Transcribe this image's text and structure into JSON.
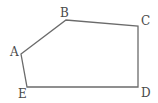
{
  "figure": {
    "type": "pentagon",
    "stroke_color": "#6b6b6b",
    "label_color": "#4a4a4a",
    "vertices": [
      {
        "name": "A",
        "x": 21,
        "y": 54,
        "label_x": 10,
        "label_y": 56
      },
      {
        "name": "B",
        "x": 66,
        "y": 20,
        "label_x": 60,
        "label_y": 17
      },
      {
        "name": "C",
        "x": 138,
        "y": 26,
        "label_x": 141,
        "label_y": 25
      },
      {
        "name": "D",
        "x": 138,
        "y": 87,
        "label_x": 141,
        "label_y": 97
      },
      {
        "name": "E",
        "x": 27,
        "y": 87,
        "label_x": 18,
        "label_y": 98
      }
    ]
  }
}
